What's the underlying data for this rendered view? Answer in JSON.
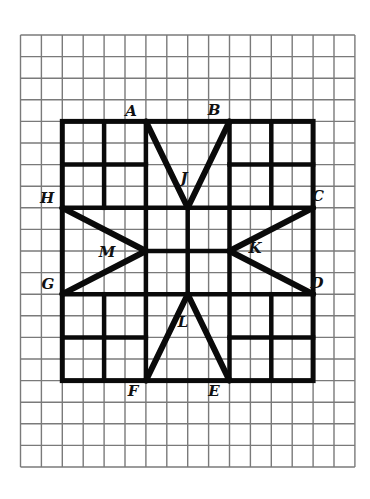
{
  "figure": {
    "grid": {
      "origin_x": 20.5,
      "origin_y": 35,
      "cell_w": 20.9,
      "cell_h": 21.6,
      "cols": 16,
      "rows": 20,
      "line_color": "#7a7a7a"
    },
    "bold_color": "#0a0a0a",
    "bold_square": {
      "col0": 2,
      "row0": 4,
      "col1": 14,
      "row1": 16
    },
    "bold_lines": [
      [
        2,
        8,
        14,
        8
      ],
      [
        2,
        12,
        14,
        12
      ],
      [
        6,
        4,
        6,
        16
      ],
      [
        10,
        4,
        10,
        16
      ],
      [
        2,
        6,
        6,
        6
      ],
      [
        4,
        4,
        4,
        8
      ],
      [
        10,
        6,
        14,
        6
      ],
      [
        12,
        4,
        12,
        8
      ],
      [
        2,
        14,
        6,
        14
      ],
      [
        4,
        12,
        4,
        16
      ],
      [
        10,
        14,
        14,
        14
      ],
      [
        12,
        12,
        12,
        16
      ],
      [
        8,
        8,
        8,
        12
      ],
      [
        6,
        10,
        10,
        10
      ]
    ],
    "star_segments": [
      [
        "A",
        "J"
      ],
      [
        "J",
        "B"
      ],
      [
        "C",
        "K"
      ],
      [
        "K",
        "D"
      ],
      [
        "E",
        "L"
      ],
      [
        "L",
        "F"
      ],
      [
        "G",
        "M"
      ],
      [
        "M",
        "H"
      ]
    ],
    "points": {
      "A": {
        "col": 6,
        "row": 4
      },
      "B": {
        "col": 10,
        "row": 4
      },
      "C": {
        "col": 14,
        "row": 8
      },
      "D": {
        "col": 14,
        "row": 12
      },
      "E": {
        "col": 10,
        "row": 16
      },
      "F": {
        "col": 6,
        "row": 16
      },
      "G": {
        "col": 2,
        "row": 12
      },
      "H": {
        "col": 2,
        "row": 8
      },
      "J": {
        "col": 8,
        "row": 8
      },
      "K": {
        "col": 10,
        "row": 10
      },
      "L": {
        "col": 8,
        "row": 12
      },
      "M": {
        "col": 6,
        "row": 10
      }
    },
    "labels": [
      {
        "text": "A",
        "x": 131,
        "y": 111
      },
      {
        "text": "B",
        "x": 214,
        "y": 110
      },
      {
        "text": "C",
        "x": 318,
        "y": 196
      },
      {
        "text": "D",
        "x": 317,
        "y": 283
      },
      {
        "text": "E",
        "x": 214,
        "y": 391
      },
      {
        "text": "F",
        "x": 133,
        "y": 391
      },
      {
        "text": "G",
        "x": 48,
        "y": 284
      },
      {
        "text": "H",
        "x": 47,
        "y": 198
      },
      {
        "text": "J",
        "x": 184,
        "y": 178
      },
      {
        "text": "K",
        "x": 255,
        "y": 248
      },
      {
        "text": "L",
        "x": 183,
        "y": 322
      },
      {
        "text": "M",
        "x": 107,
        "y": 252
      }
    ]
  }
}
